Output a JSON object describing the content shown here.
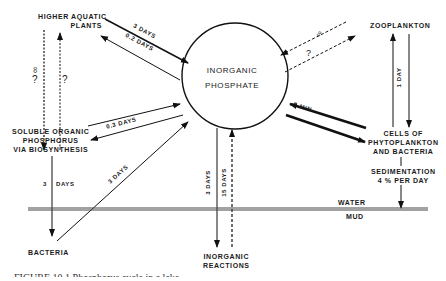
{
  "diagram": {
    "title": "Phosphorus cycle in a lake",
    "center": {
      "line1": "INORGANIC",
      "line2": "PHOSPHATE"
    },
    "nodes": {
      "higher_aquatic_plants": {
        "line1": "HIGHER AQUATIC",
        "line2": "PLANTS"
      },
      "zooplankton": {
        "line1": "ZOOPLANKTON"
      },
      "soluble_organic": {
        "line1": "SOLUBLE ORGANIC",
        "line2": "PHOSPHORUS",
        "line3": "VIA BIOSYNTHESIS"
      },
      "cells": {
        "line1": "CELLS OF",
        "line2": "PHYTOPLANKTON",
        "line3": "AND BACTERIA"
      },
      "sedimentation": {
        "line1": "SEDIMENTATION",
        "line2": "4 % PER DAY"
      },
      "bacteria": {
        "line1": "BACTERIA"
      },
      "inorganic_reactions": {
        "line1": "INORGANIC",
        "line2": "REACTIONS"
      }
    },
    "layers": {
      "water": "WATER",
      "mud": "MUD"
    },
    "edges": {
      "plants_to_phosphate": "3 DAYS",
      "phosphate_to_plants": "0.2 DAYS",
      "phosphate_soluble": "0.3 DAYS",
      "bacteria_to_phosphate": "3 DAYS",
      "soluble_to_bacteria_3": "3",
      "soluble_to_bacteria_days": "DAYS",
      "phosphate_to_reactions": "3 DAYS",
      "reactions_to_phosphate": "15 DAYS",
      "phosphate_cells": "5 MIN",
      "zooplankton_cells": "1 DAY",
      "unknown_infinity": "∞",
      "unknown_question": "?"
    },
    "caption": "FIGURE 10.1  Phosphorus cycle in a lake."
  }
}
